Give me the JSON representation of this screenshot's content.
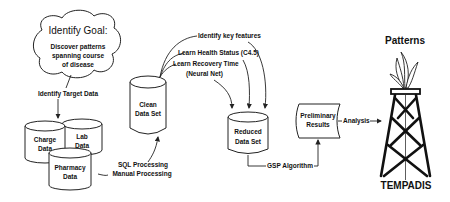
{
  "diagram": {
    "goal_cloud": {
      "title": "Identify Goal:",
      "line1": "Discover patterns",
      "line2": "spanning course",
      "line3": "of disease"
    },
    "identify_target": "Identify Target Data",
    "sources": {
      "charge": [
        "Charge",
        "Data"
      ],
      "lab": [
        "Lab",
        "Data"
      ],
      "pharmacy": [
        "Pharmacy",
        "Data"
      ]
    },
    "processing": {
      "line1": "SQL Processing",
      "line2": "Manual Processing"
    },
    "clean_data": [
      "Clean",
      "Data Set"
    ],
    "feature_steps": {
      "step1": "Identify key features",
      "step2": "Learn Health Status (C4.5)",
      "step3a": "Learn Recovery Time",
      "step3b": "(Neural Net)"
    },
    "reduced_data": [
      "Reduced",
      "Data Set"
    ],
    "algorithm": "GSP Algorithm",
    "preliminary": [
      "Preliminary",
      "Results"
    ],
    "analysis": "Analysis",
    "output": {
      "top": "Patterns",
      "bottom": "TEMPADIS"
    }
  }
}
